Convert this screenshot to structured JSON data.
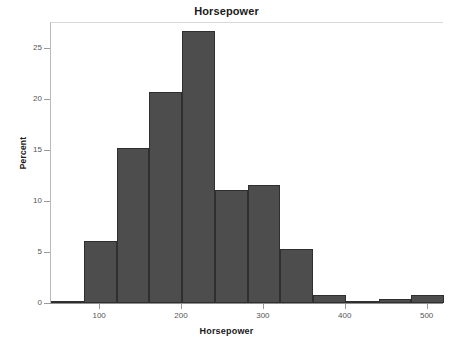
{
  "chart_data": {
    "type": "bar",
    "title": "Horsepower",
    "xlabel": "Horsepower",
    "ylabel": "Percent",
    "grid": false,
    "legend": null,
    "xlim": [
      40,
      520
    ],
    "ylim": [
      0,
      27.6
    ],
    "bin_width": 40,
    "bin_starts": [
      40,
      80,
      120,
      160,
      200,
      240,
      280,
      320,
      360,
      400,
      440,
      480
    ],
    "bin_ends": [
      80,
      120,
      160,
      200,
      240,
      280,
      320,
      360,
      400,
      440,
      480,
      520
    ],
    "categories": [
      "40-80",
      "80-120",
      "120-160",
      "160-200",
      "200-240",
      "240-280",
      "280-320",
      "320-360",
      "360-400",
      "400-440",
      "440-480",
      "480-520"
    ],
    "values": [
      0.2,
      6.1,
      15.2,
      20.7,
      26.7,
      11.1,
      11.6,
      5.3,
      0.8,
      0.15,
      0.4,
      0.8
    ],
    "xticks": [
      100,
      200,
      300,
      400,
      500
    ],
    "xtick_labels": [
      "100",
      "200",
      "300",
      "400",
      "500"
    ],
    "yticks": [
      0,
      5,
      10,
      15,
      20,
      25
    ],
    "ytick_labels": [
      "0",
      "5",
      "10",
      "15",
      "20",
      "25"
    ],
    "bar_color": "#4d4d4d",
    "bar_edge_color": "#2f2f2f",
    "axis_color": "#9a9a9a",
    "background_color": "#ffffff"
  }
}
